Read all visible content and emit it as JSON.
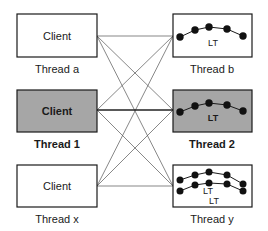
{
  "colors": {
    "box_border": "#1a1a1a",
    "box_fill_normal": "#ffffff",
    "box_fill_highlight": "#a6a6a6",
    "line": "#555555",
    "dot": "#111111"
  },
  "left": [
    {
      "id": "client-a",
      "text": "Client",
      "label": "Thread a",
      "highlight": false
    },
    {
      "id": "client-1",
      "text": "Client",
      "label": "Thread 1",
      "highlight": true
    },
    {
      "id": "client-x",
      "text": "Client",
      "label": "Thread x",
      "highlight": false
    }
  ],
  "right": [
    {
      "id": "server-b",
      "lt_labels": [
        "LT"
      ],
      "label": "Thread b",
      "highlight": false
    },
    {
      "id": "server-2",
      "lt_labels": [
        "LT"
      ],
      "label": "Thread 2",
      "highlight": true
    },
    {
      "id": "server-y",
      "lt_labels": [
        "LT",
        "LT"
      ],
      "label": "Thread y",
      "highlight": false
    }
  ],
  "connections": "every left box connected to every right box; Thread 1 to Thread 2 emphasized"
}
